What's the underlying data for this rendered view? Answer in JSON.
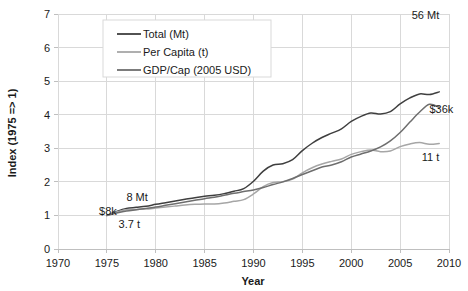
{
  "chart_data": {
    "type": "line",
    "title": "",
    "xlabel": "Year",
    "ylabel": "Index (1975 => 1)",
    "xlim": [
      1970,
      2010
    ],
    "ylim": [
      0,
      7
    ],
    "grid": true,
    "legend_position": "top-left-inside",
    "xticks": [
      "1970",
      "1975",
      "1980",
      "1985",
      "1990",
      "1995",
      "2000",
      "2005",
      "2010"
    ],
    "yticks": [
      "0",
      "1",
      "2",
      "3",
      "4",
      "5",
      "6",
      "7"
    ],
    "x": [
      1975,
      1976,
      1977,
      1978,
      1979,
      1980,
      1981,
      1982,
      1983,
      1984,
      1985,
      1986,
      1987,
      1988,
      1989,
      1990,
      1991,
      1992,
      1993,
      1994,
      1995,
      1996,
      1997,
      1998,
      1999,
      2000,
      2001,
      2002,
      2003,
      2004,
      2005,
      2006,
      2007,
      2008,
      2009
    ],
    "series": [
      {
        "name": "Total (Mt)",
        "color": "#3f3f3f",
        "values": [
          1.0,
          1.12,
          1.21,
          1.24,
          1.27,
          1.33,
          1.38,
          1.43,
          1.48,
          1.53,
          1.57,
          1.6,
          1.65,
          1.72,
          1.8,
          2.02,
          2.32,
          2.5,
          2.54,
          2.66,
          2.93,
          3.15,
          3.32,
          3.45,
          3.58,
          3.8,
          3.95,
          4.05,
          4.02,
          4.09,
          4.32,
          4.5,
          4.62,
          4.6,
          4.68
        ]
      },
      {
        "name": "Per Capita (t)",
        "color": "#a6a6a6",
        "values": [
          1.0,
          1.1,
          1.17,
          1.18,
          1.19,
          1.22,
          1.25,
          1.28,
          1.31,
          1.33,
          1.34,
          1.34,
          1.37,
          1.42,
          1.47,
          1.64,
          1.86,
          1.98,
          2.0,
          2.08,
          2.27,
          2.42,
          2.53,
          2.61,
          2.68,
          2.82,
          2.9,
          2.95,
          2.9,
          2.92,
          3.05,
          3.13,
          3.17,
          3.12,
          3.14
        ]
      },
      {
        "name": "GDP/Cap (2005 USD)",
        "color": "#6e6e6e",
        "values": [
          1.0,
          1.07,
          1.13,
          1.17,
          1.21,
          1.25,
          1.3,
          1.35,
          1.4,
          1.45,
          1.5,
          1.54,
          1.6,
          1.66,
          1.71,
          1.76,
          1.83,
          1.92,
          2.0,
          2.1,
          2.22,
          2.33,
          2.44,
          2.5,
          2.6,
          2.74,
          2.83,
          2.92,
          3.04,
          3.22,
          3.47,
          3.78,
          4.08,
          4.31,
          4.22
        ]
      }
    ],
    "annotations": [
      {
        "name": "total-end-label",
        "text": "56 Mt",
        "x": 2009,
        "y": 6.85,
        "anchor": "end"
      },
      {
        "name": "gdp-end-label",
        "text": "$36k",
        "x": 2008,
        "y": 4.05,
        "anchor": "start"
      },
      {
        "name": "percap-end-label",
        "text": "11 t",
        "x": 2009,
        "y": 2.62,
        "anchor": "end"
      },
      {
        "name": "total-start-label",
        "text": "8 Mt",
        "x": 1977,
        "y": 1.42,
        "anchor": "start"
      },
      {
        "name": "gdp-start-label",
        "text": "$8k",
        "x": 1974.2,
        "y": 1.02,
        "anchor": "start"
      },
      {
        "name": "percap-start-label",
        "text": "3.7 t",
        "x": 1976.2,
        "y": 0.62,
        "anchor": "start"
      }
    ]
  }
}
